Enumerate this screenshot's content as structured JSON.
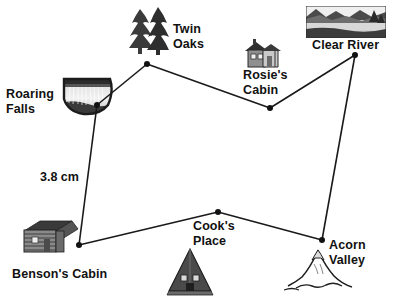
{
  "diagram": {
    "background": "#ffffff",
    "stroke_color": "#1a1a1a",
    "node_color": "#111111",
    "width": 399,
    "height": 304,
    "measurement": {
      "text": "3.8 cm",
      "x": 40,
      "y": 170
    },
    "nodes": [
      {
        "id": "roaring-falls",
        "label": "Roaring\nFalls",
        "x": 97,
        "y": 105,
        "label_x": 6,
        "label_y": 87,
        "icon": "waterfall-icon",
        "icon_x": 62,
        "icon_y": 75,
        "icon_w": 52,
        "icon_h": 42
      },
      {
        "id": "twin-oaks",
        "label": "Twin\nOaks",
        "x": 147,
        "y": 64,
        "label_x": 173,
        "label_y": 22,
        "icon": "trees-icon",
        "icon_x": 127,
        "icon_y": 6,
        "icon_w": 44,
        "icon_h": 50
      },
      {
        "id": "rosies-cabin",
        "label": "Rosie's\nCabin",
        "x": 270,
        "y": 108,
        "label_x": 243,
        "label_y": 68,
        "icon": "cabin-icon",
        "icon_x": 240,
        "icon_y": 38,
        "icon_w": 44,
        "icon_h": 32
      },
      {
        "id": "clear-river",
        "label": "Clear River",
        "x": 355,
        "y": 55,
        "label_x": 312,
        "label_y": 38,
        "icon": "river-icon",
        "icon_x": 306,
        "icon_y": 6,
        "icon_w": 80,
        "icon_h": 32
      },
      {
        "id": "acorn-valley",
        "label": "Acorn\nValley",
        "x": 322,
        "y": 240,
        "label_x": 329,
        "label_y": 238,
        "icon": "mountain-icon",
        "icon_x": 282,
        "icon_y": 244,
        "icon_w": 72,
        "icon_h": 50
      },
      {
        "id": "cooks-place",
        "label": "Cook's\nPlace",
        "x": 218,
        "y": 212,
        "label_x": 193,
        "label_y": 219,
        "icon": "a-frame-icon",
        "icon_x": 166,
        "icon_y": 247,
        "icon_w": 50,
        "icon_h": 50
      },
      {
        "id": "bensons-cabin",
        "label": "Benson's Cabin",
        "x": 79,
        "y": 245,
        "label_x": 12,
        "label_y": 267,
        "icon": "log-cabin-icon",
        "icon_x": 22,
        "icon_y": 215,
        "icon_w": 58,
        "icon_h": 44
      }
    ],
    "edges": [
      {
        "from": "roaring-falls",
        "to": "twin-oaks"
      },
      {
        "from": "twin-oaks",
        "to": "rosies-cabin"
      },
      {
        "from": "rosies-cabin",
        "to": "clear-river"
      },
      {
        "from": "clear-river",
        "to": "acorn-valley"
      },
      {
        "from": "acorn-valley",
        "to": "cooks-place"
      },
      {
        "from": "cooks-place",
        "to": "bensons-cabin"
      },
      {
        "from": "bensons-cabin",
        "to": "roaring-falls"
      }
    ]
  }
}
